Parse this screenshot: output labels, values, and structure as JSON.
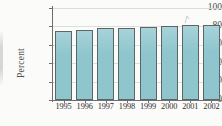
{
  "chart_data": {
    "type": "bar",
    "title": "",
    "subtitle": "",
    "xlabel": "",
    "ylabel": "Percent",
    "categories": [
      "1995",
      "1996",
      "1997",
      "1998",
      "1999",
      "2000",
      "2001",
      "2002"
    ],
    "values": [
      75,
      76.5,
      78,
      78,
      79.5,
      80,
      81.5,
      81.5
    ],
    "ylim": [
      0,
      100
    ],
    "yticks": [
      0,
      20,
      40,
      60,
      80,
      100
    ],
    "ytick_labels": [
      "0",
      "20",
      "40",
      "60",
      "80",
      "100"
    ],
    "grid": true,
    "grid_axis": "y",
    "legend": false,
    "legend_position": "none",
    "bar_color": "#8fc6ce",
    "bar_edge_color": "#5c6668",
    "grid_color": "#d8d8d4",
    "axis_color": "#6e6e6e",
    "background_color": "#fbfbf9",
    "annotations": [
      {
        "name": "stray-tick-mark",
        "near_category": "2001",
        "text": ""
      }
    ]
  },
  "axes": {
    "y_title": "Percent",
    "y_tick_0": "0",
    "y_tick_1": "20",
    "y_tick_2": "40",
    "y_tick_3": "60",
    "y_tick_4": "80",
    "y_tick_5": "100",
    "x_tick_0": "1995",
    "x_tick_1": "1996",
    "x_tick_2": "1997",
    "x_tick_3": "1998",
    "x_tick_4": "1999",
    "x_tick_5": "2000",
    "x_tick_6": "2001",
    "x_tick_7": "2002"
  }
}
